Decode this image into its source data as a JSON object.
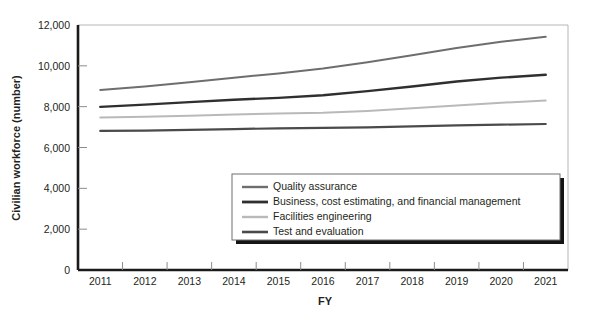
{
  "chart_data": {
    "type": "line",
    "title": "",
    "xlabel": "FY",
    "ylabel": "Civilian workforce (number)",
    "categories": [
      "2011",
      "2012",
      "2013",
      "2014",
      "2015",
      "2016",
      "2017",
      "2018",
      "2019",
      "2020",
      "2021"
    ],
    "x": [
      2011,
      2012,
      2013,
      2014,
      2015,
      2016,
      2017,
      2018,
      2019,
      2020,
      2021
    ],
    "ylim": [
      0,
      12000
    ],
    "yticks": [
      0,
      2000,
      4000,
      6000,
      8000,
      10000,
      12000
    ],
    "ytick_labels": [
      "0",
      "2,000",
      "4,000",
      "6,000",
      "8,000",
      "10,000",
      "12,000"
    ],
    "grid": false,
    "legend_position": "lower-right-inside",
    "series": [
      {
        "name": "Quality assurance",
        "color": "#6e6e6e",
        "width": 2.0,
        "values": [
          8820,
          8990,
          9190,
          9420,
          9630,
          9870,
          10180,
          10520,
          10870,
          11180,
          11430
        ]
      },
      {
        "name": "Business, cost estimating, and financial management",
        "color": "#2f2f2f",
        "width": 2.4,
        "values": [
          7990,
          8100,
          8220,
          8340,
          8430,
          8560,
          8760,
          8990,
          9230,
          9420,
          9560
        ]
      },
      {
        "name": "Facilities engineering",
        "color": "#b9b9b9",
        "width": 2.0,
        "values": [
          7470,
          7510,
          7560,
          7620,
          7660,
          7700,
          7790,
          7920,
          8060,
          8190,
          8300
        ]
      },
      {
        "name": "Test and evaluation",
        "color": "#4a4a4a",
        "width": 2.2,
        "values": [
          6810,
          6830,
          6860,
          6900,
          6940,
          6960,
          6990,
          7030,
          7080,
          7120,
          7150
        ]
      }
    ]
  },
  "legend": {
    "items": [
      {
        "label": "Quality assurance"
      },
      {
        "label": "Business, cost estimating, and financial management"
      },
      {
        "label": "Facilities engineering"
      },
      {
        "label": "Test and evaluation"
      }
    ]
  }
}
